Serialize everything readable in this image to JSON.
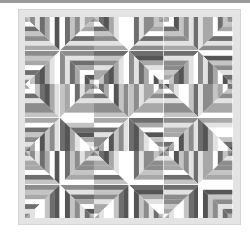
{
  "image": {
    "subject": "grayscale striped quilt",
    "grid": {
      "rows": 6,
      "cols": 6
    },
    "colors": {
      "top_bar": "#9a9a9a",
      "frame": "#e4e4e4",
      "background": "#ffffff",
      "stripe_palette": [
        "#ffffff",
        "#e2e2e2",
        "#c4c4c4",
        "#a8a8a8",
        "#8c8c8c",
        "#6e6e6e",
        "#555555"
      ]
    },
    "stripe_sets": [
      [
        "#c4c4c4",
        "#8c8c8c",
        "#e2e2e2",
        "#6e6e6e",
        "#a8a8a8",
        "#ffffff",
        "#555555"
      ],
      [
        "#a8a8a8",
        "#ffffff",
        "#6e6e6e",
        "#c4c4c4",
        "#8c8c8c",
        "#e2e2e2",
        "#a8a8a8"
      ],
      [
        "#ffffff",
        "#ffffff",
        "#c4c4c4",
        "#6e6e6e",
        "#555555",
        "#a8a8a8",
        "#e2e2e2"
      ],
      [
        "#8c8c8c",
        "#c4c4c4",
        "#a8a8a8",
        "#ffffff",
        "#6e6e6e",
        "#e2e2e2",
        "#8c8c8c"
      ]
    ]
  }
}
